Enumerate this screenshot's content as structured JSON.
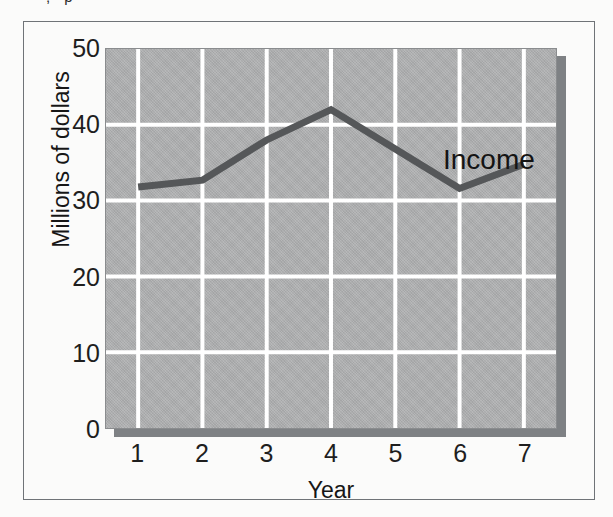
{
  "figure": {
    "clipped_text_above": ", p",
    "series_annotation": "Income",
    "frame_color": "#6f7377",
    "panel_color": "#b0b1b2",
    "panel_shadow_color": "#7e8184",
    "gridline_color": "#ffffff",
    "line_color": "#555759",
    "text_color": "#1e1e1e"
  },
  "chart_data": {
    "type": "line",
    "title": "",
    "subtitle": "",
    "xlabel": "Year",
    "ylabel": "Millions of dollars",
    "x": [
      1,
      2,
      3,
      4,
      5,
      6,
      7
    ],
    "categories": [
      "1",
      "2",
      "3",
      "4",
      "5",
      "6",
      "7"
    ],
    "xtick_labels": [
      "1",
      "2",
      "3",
      "4",
      "5",
      "6",
      "7"
    ],
    "ytick_labels": [
      "0",
      "10",
      "20",
      "30",
      "40",
      "50"
    ],
    "yticks": [
      0,
      10,
      20,
      30,
      40,
      50
    ],
    "xlim": [
      0.5,
      7.5
    ],
    "ylim": [
      0,
      50
    ],
    "grid": true,
    "grid_axes": "both",
    "legend": false,
    "legend_position": "none",
    "annotations": [
      {
        "text": "Income",
        "x": 5.6,
        "y": 38
      }
    ],
    "series": [
      {
        "name": "Income",
        "values": [
          31.8,
          32.7,
          38.0,
          42.0,
          36.8,
          31.6,
          34.8
        ]
      }
    ]
  }
}
